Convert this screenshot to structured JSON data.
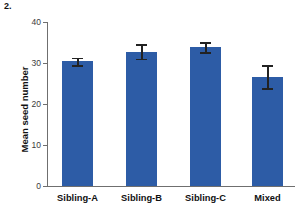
{
  "figure": {
    "number_label": "2."
  },
  "chart_data": {
    "type": "bar",
    "title": "",
    "xlabel": "",
    "ylabel": "Mean seed number",
    "categories": [
      "Sibling-A",
      "Sibling-B",
      "Sibling-C",
      "Mixed"
    ],
    "values": [
      30.4,
      32.8,
      33.9,
      26.6
    ],
    "errors": [
      0.9,
      1.8,
      1.2,
      2.8
    ],
    "ylim": [
      0,
      40
    ],
    "yticks": [
      0,
      10,
      20,
      30,
      40
    ],
    "ytick_labels": [
      "0",
      "10",
      "20",
      "30",
      "40"
    ],
    "grid": false,
    "legend": null,
    "bar_color": "#2d5ca6",
    "error_color": "#222222",
    "axis_color": "#6f6f6f"
  }
}
